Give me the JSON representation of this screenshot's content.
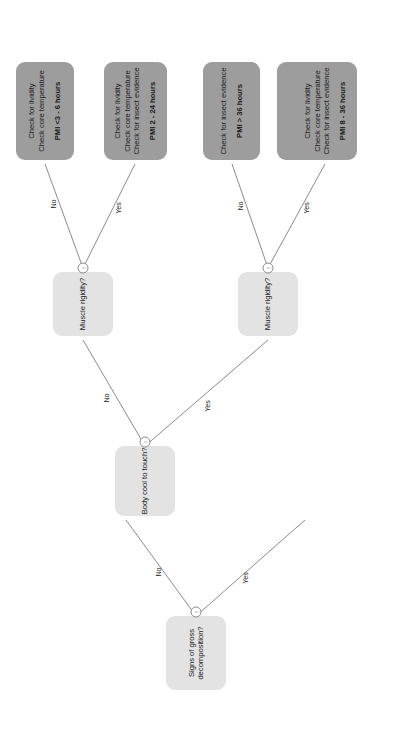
{
  "diagram": {
    "orientation": "rotated-90-ccw",
    "colors": {
      "decision_node": "#e3e3e3",
      "terminal_node": "#9d9d9d",
      "edge": "#8b8b8b",
      "text": "#1b1b1b",
      "background": "#ffffff"
    },
    "nodes": {
      "root": {
        "kind": "decision",
        "line1": "Signs of gross",
        "line2": "decomposition?"
      },
      "body_cool": {
        "kind": "decision",
        "line1": "Body cool to touch?"
      },
      "muscle_rigidity_upper": {
        "kind": "decision",
        "line1": "Muscle rigidity?"
      },
      "muscle_rigidity_lower": {
        "kind": "decision",
        "line1": "Muscle rigidity?"
      },
      "terminal_insect_activity": {
        "kind": "terminal",
        "line1": "Check for insect activity",
        "pmi": "PMI > 36 hours"
      },
      "terminal_lividity_core": {
        "kind": "terminal",
        "line1": "Check for lividity",
        "line2": "Check core temperature",
        "pmi": "PMI <3 - 6 hours"
      },
      "terminal_lividity_core_insect_2_24": {
        "kind": "terminal",
        "line1": "Check for lividity",
        "line2": "Check core temperature",
        "line3": "Check for insect evidence",
        "pmi": "PMI 2 - 24 hours"
      },
      "terminal_insect_evidence": {
        "kind": "terminal",
        "line1": "Check for insect evidence",
        "pmi": "PMI > 36 hours"
      },
      "terminal_lividity_core_insect_8_36": {
        "kind": "terminal",
        "line1": "Check for lividity",
        "line2": "Check core temperature",
        "line3": "Check for insect evidence",
        "pmi": "PMI 8 - 36 hours"
      }
    },
    "edge_labels": {
      "root_no": "No",
      "root_yes": "Yes",
      "body_cool_no": "No",
      "body_cool_yes": "Yes",
      "rigidity_upper_no": "No",
      "rigidity_upper_yes": "Yes",
      "rigidity_lower_no": "No",
      "rigidity_lower_yes": "Yes"
    },
    "markers": {
      "root": "!",
      "body_cool": "!",
      "muscle_rigidity_upper": "!",
      "muscle_rigidity_lower": "!"
    }
  }
}
